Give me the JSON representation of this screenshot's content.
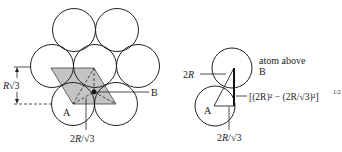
{
  "figure": {
    "colors": {
      "stroke": "#222222",
      "shade": "#c4c4c4",
      "background": "#ffffff"
    }
  },
  "left_diagram": {
    "labels": {
      "height_R": "R",
      "height_sqrt": "√3",
      "height_three": "3",
      "point_a": "A",
      "point_b": "B",
      "distance_2R": "2R",
      "distance_slash": "/",
      "distance_sqrt": "√3"
    }
  },
  "right_diagram": {
    "labels": {
      "atom_above": "atom above",
      "point_b": "B",
      "point_a": "A",
      "hyp_2R": "2R",
      "base_2R": "2R",
      "base_slash": "/",
      "base_sqrt": "√3",
      "height_formula": "[(2R)² − (2R/√3)²]",
      "height_exp": "1/2"
    }
  }
}
